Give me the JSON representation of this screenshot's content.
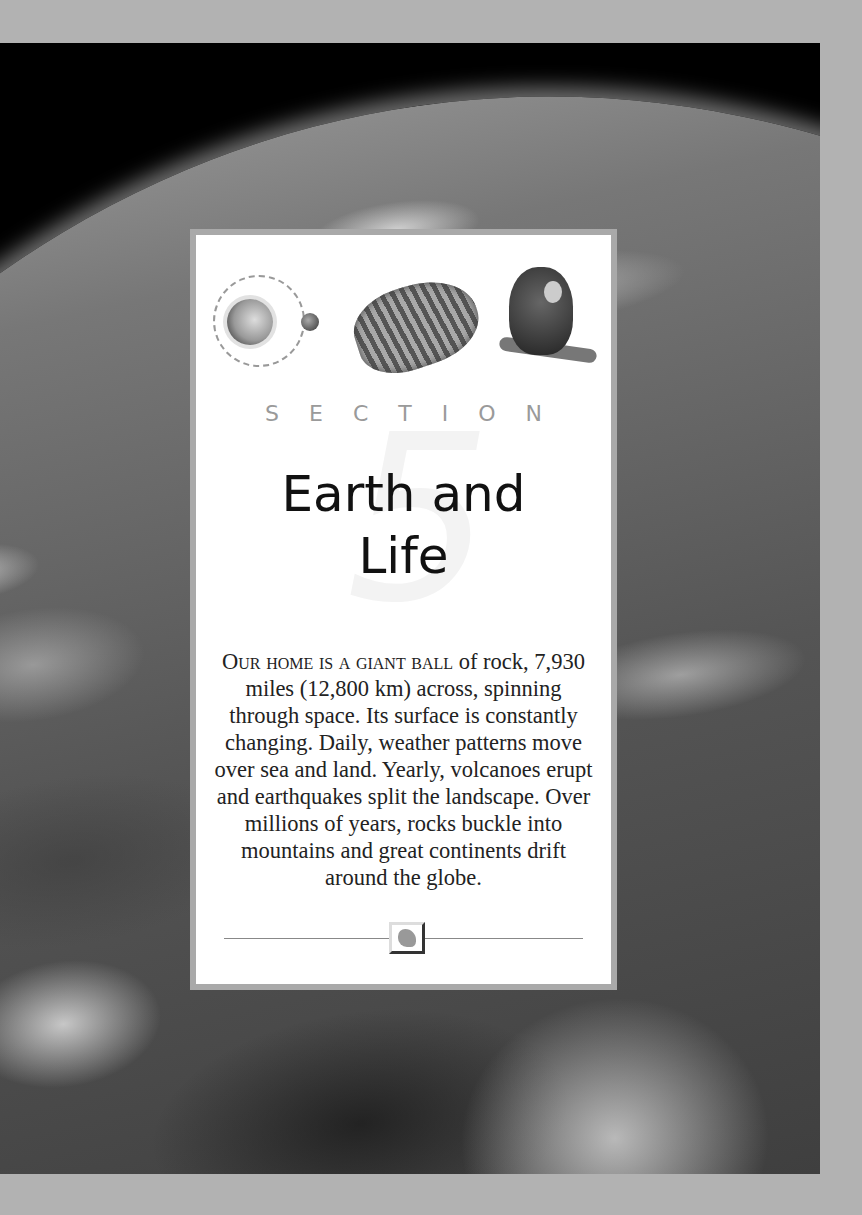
{
  "page": {
    "background_photo": "earth-from-space-icon",
    "colors": {
      "page_bg": "#b2b2b2",
      "card_border": "#a9a9a9",
      "section_label": "#9a9a9a",
      "title": "#111111"
    }
  },
  "card": {
    "icons": [
      "earth-moon-orbit-icon",
      "fossil-tooth-icon",
      "monkey-icon"
    ],
    "section_label": "SECTION",
    "section_number": "5",
    "title_line1": "Earth and",
    "title_line2": "Life",
    "intro_smallcaps": "Our home is a giant ball",
    "intro_text": " of rock, 7,930 miles (12,800 km) across, spinning through space. Its surface is constantly changing. Daily, weather patterns move over sea and land. Yearly, volcanoes erupt and earthquakes split the landscape. Over millions of years, rocks buckle into mountains and great continents drift around the globe.",
    "footer_emblem": "map-emblem-icon"
  }
}
